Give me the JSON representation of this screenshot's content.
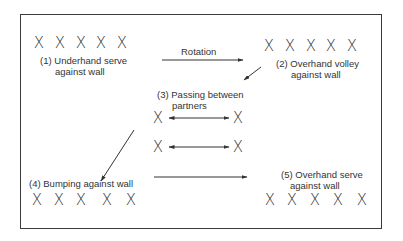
{
  "diagram": {
    "stations": [
      {
        "id": 1,
        "number": "(1)",
        "line1": "Underhand serve",
        "line2": "against wall",
        "players": [
          "X",
          "X",
          "X",
          "X",
          "X"
        ]
      },
      {
        "id": 2,
        "number": "(2)",
        "line1": "Overhand volley",
        "line2": "against wall",
        "players": [
          "X",
          "X",
          "X",
          "X",
          "X"
        ]
      },
      {
        "id": 3,
        "number": "(3)",
        "line1": "Passing between",
        "line2": "partners",
        "pairs": [
          [
            "X",
            "X"
          ],
          [
            "X",
            "X"
          ]
        ]
      },
      {
        "id": 4,
        "number": "(4)",
        "line1": "Bumping against wall",
        "line2": "",
        "players": [
          "X",
          "X",
          "X",
          "X",
          "X"
        ]
      },
      {
        "id": 5,
        "number": "(5)",
        "line1": "Overhand serve",
        "line2": "against wall",
        "players": [
          "X",
          "X",
          "X",
          "X",
          "X"
        ]
      }
    ],
    "rotation_label": "Rotation",
    "arrows": [
      {
        "from": 1,
        "to": 2,
        "label": "Rotation"
      },
      {
        "from": 2,
        "to": 3
      },
      {
        "from": 3,
        "to": 4
      },
      {
        "from": 4,
        "to": 5
      }
    ],
    "colors": {
      "line": "#333333",
      "background": "#ffffff"
    }
  }
}
